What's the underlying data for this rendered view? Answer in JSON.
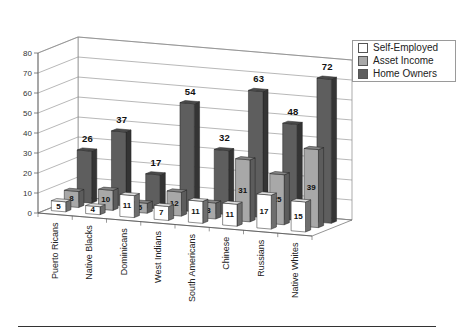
{
  "chart_data": {
    "type": "bar",
    "subtype": "3d-clustered-column",
    "title": "",
    "xlabel": "",
    "ylabel": "",
    "ylim": [
      0,
      80
    ],
    "yticks": [
      0,
      10,
      20,
      30,
      40,
      50,
      60,
      70,
      80
    ],
    "grid": true,
    "legend_position": "top-right",
    "categories": [
      "Puerto Ricans",
      "Native Blacks",
      "Dominicans",
      "West Indians",
      "South Americans",
      "Chinese",
      "Russians",
      "Native Whites"
    ],
    "series": [
      {
        "name": "Self-Employed",
        "color": "#ffffff",
        "values": [
          5,
          4,
          11,
          7,
          11,
          11,
          17,
          15
        ]
      },
      {
        "name": "Asset Income",
        "color": "#a8a8a8",
        "values": [
          8,
          10,
          5,
          12,
          8,
          31,
          25,
          39
        ]
      },
      {
        "name": "Home Owners",
        "color": "#5e5e5e",
        "values": [
          26,
          37,
          17,
          54,
          32,
          63,
          48,
          72
        ]
      }
    ]
  },
  "legend": {
    "items": [
      {
        "label": "Self-Employed",
        "color": "#ffffff"
      },
      {
        "label": "Asset Income",
        "color": "#a8a8a8"
      },
      {
        "label": "Home Owners",
        "color": "#5e5e5e"
      }
    ]
  }
}
